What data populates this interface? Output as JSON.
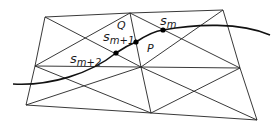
{
  "diagram": {
    "type": "triangulated mesh with curve",
    "stroke_color": "#222222",
    "vertices": {
      "tl": [
        45,
        17
      ],
      "tm": [
        130,
        13
      ],
      "tr": [
        223,
        10
      ],
      "ml": [
        35,
        66
      ],
      "mm": [
        141,
        67
      ],
      "mr": [
        240,
        68
      ],
      "bl": [
        26,
        105
      ],
      "bm": [
        151,
        113
      ],
      "br": [
        257,
        120
      ]
    },
    "curve_path": "M 13 84 C 50 86, 90 74, 116 53 C 126 46, 131 44, 136 42 C 145 36, 155 31, 163 30 C 195 24, 240 22, 270 35",
    "points": [
      {
        "id": "s_m",
        "x": 163,
        "y": 30
      },
      {
        "id": "s_m+1",
        "x": 136,
        "y": 42
      },
      {
        "id": "s_m+2",
        "x": 116,
        "y": 53
      }
    ],
    "labels": {
      "s_m": {
        "base": "s",
        "sub": "m",
        "x": 160,
        "y": 25
      },
      "s_m1": {
        "base": "s",
        "sub": "m+1",
        "x": 103,
        "y": 41
      },
      "s_m2": {
        "base": "s",
        "sub": "m+2",
        "x": 70,
        "y": 63
      },
      "Q": {
        "text": "Q",
        "x": 117,
        "y": 29
      },
      "P": {
        "text": "P",
        "x": 147,
        "y": 52
      }
    }
  }
}
